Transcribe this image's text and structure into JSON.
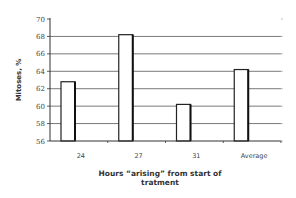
{
  "chart_data": {
    "type": "bar",
    "title": "",
    "xlabel": "Hours “arising” from start of tratment",
    "xlabel_lines": [
      "Hours “arising” from start of",
      "tratment"
    ],
    "ylabel": "Mitoses, %",
    "categories": [
      "24",
      "27",
      "31",
      "Average"
    ],
    "values": [
      62.8,
      68.2,
      60.2,
      64.2
    ],
    "ylim": [
      56,
      70
    ],
    "yticks": [
      56,
      58,
      60,
      62,
      64,
      66,
      68,
      70
    ],
    "grid": true,
    "legend": null,
    "bar_fill": "#ffffff",
    "bar_stroke": "#222222",
    "grid_color": "#555555"
  }
}
